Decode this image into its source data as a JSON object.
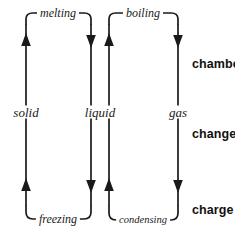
{
  "diagram": {
    "type": "state-change-cycle",
    "background_color": "#ffffff",
    "stroke_color": "#1a1a1a",
    "phases": [
      {
        "label": "solid",
        "x": 26,
        "y": 112
      },
      {
        "label": "liquid",
        "x": 100,
        "y": 112
      },
      {
        "label": "gas",
        "x": 178,
        "y": 112
      }
    ],
    "transitions": [
      {
        "label": "melting",
        "x": 58,
        "y": 13,
        "position": "top",
        "from": "solid",
        "to": "liquid"
      },
      {
        "label": "boiling",
        "x": 143,
        "y": 13,
        "position": "top",
        "from": "liquid",
        "to": "gas"
      },
      {
        "label": "freezing",
        "x": 58,
        "y": 219,
        "position": "bottom",
        "from": "liquid",
        "to": "solid"
      },
      {
        "label": "condensing",
        "x": 143,
        "y": 220,
        "position": "bottom",
        "from": "gas",
        "to": "liquid"
      }
    ],
    "arrows": [
      {
        "x": 26,
        "direction": "up"
      },
      {
        "x": 91,
        "direction": "down"
      },
      {
        "x": 109,
        "direction": "up"
      },
      {
        "x": 178,
        "direction": "down"
      }
    ],
    "side_labels": [
      {
        "text": "chambe",
        "x": 192,
        "y": 58,
        "clipped": true
      },
      {
        "text": "change",
        "x": 192,
        "y": 128,
        "clipped": true
      },
      {
        "text": "charge",
        "x": 192,
        "y": 204,
        "clipped": false
      }
    ]
  }
}
